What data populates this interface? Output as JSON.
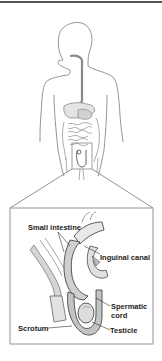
{
  "figure": {
    "overview": "Human torso outline with digestive tract; highlighted groin region magnified below",
    "labels": {
      "small_intestine": "Small intestine",
      "inguinal_canal": "Inguinal canal",
      "spermatic_cord_line1": "Spermatic",
      "spermatic_cord_line2": "cord",
      "scrotum": "Scrotum",
      "testicle": "Testicle"
    },
    "colors": {
      "line": "#777777",
      "dark_line": "#333333",
      "fill_light": "#e6e6e6",
      "fill_mid": "#c8c8c8",
      "rule": "#555555"
    }
  }
}
